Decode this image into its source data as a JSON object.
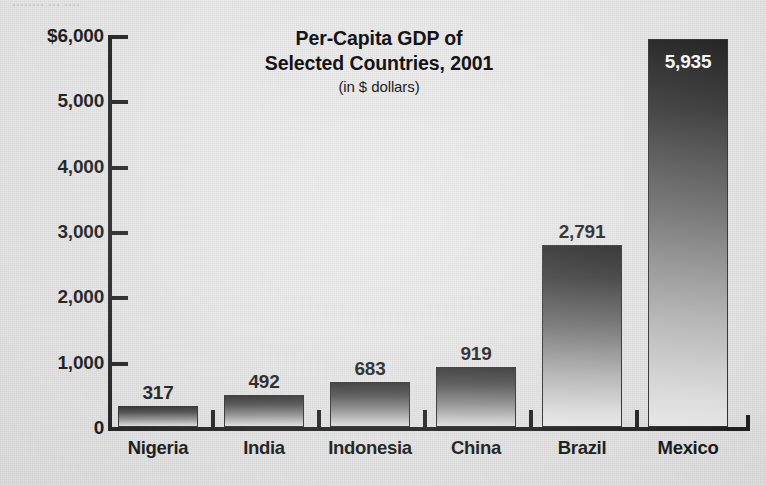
{
  "scan": {
    "top_fragment": "........ ... ...."
  },
  "chart_data": {
    "type": "bar",
    "title": "Per-Capita GDP of Selected Countries, 2001",
    "title_line1": "Per-Capita GDP of",
    "title_line2": "Selected Countries, 2001",
    "subtitle": "(in $ dollars)",
    "xlabel": "",
    "ylabel": "",
    "ylim": [
      0,
      6000
    ],
    "grid": false,
    "legend": "none",
    "y_ticks": [
      0,
      1000,
      2000,
      3000,
      4000,
      5000,
      6000
    ],
    "y_tick_labels": [
      "0",
      "1,000",
      "2,000",
      "3,000",
      "4,000",
      "5,000",
      "$6,000"
    ],
    "categories": [
      "Nigeria",
      "India",
      "Indonesia",
      "China",
      "Brazil",
      "Mexico"
    ],
    "values": [
      317,
      492,
      683,
      919,
      2791,
      5935
    ],
    "value_labels": [
      "317",
      "492",
      "683",
      "919",
      "2,791",
      "5,935"
    ],
    "bar_style": "vertical-gradient dark-top to light-bottom, thin dark outline",
    "colors": {
      "background": "#e9e9e9",
      "axis": "#1a1a1a",
      "text": "#111111",
      "bar_top": "#1b1b1b",
      "bar_bottom": "#efefef",
      "inside_label": "#ffffff"
    }
  }
}
